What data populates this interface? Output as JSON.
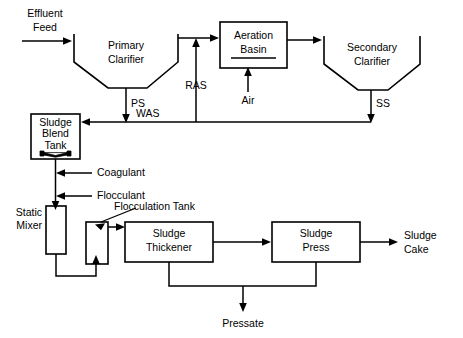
{
  "diagram": {
    "type": "process-flow-diagram",
    "canvas": {
      "width": 463,
      "height": 338
    },
    "colors": {
      "line": "#000000",
      "background": "#ffffff",
      "text": "#000000"
    },
    "units": [
      {
        "id": "primary-clarifier",
        "label_line1": "Primary",
        "label_line2": "Clarifier",
        "shape": "hopper"
      },
      {
        "id": "aeration-basin",
        "label_line1": "Aeration",
        "label_line2": "Basin",
        "shape": "rect"
      },
      {
        "id": "secondary-clarifier",
        "label_line1": "Secondary",
        "label_line2": "Clarifier",
        "shape": "hopper"
      },
      {
        "id": "sludge-blend-tank",
        "label_line1": "Sludge",
        "label_line2": "Blend",
        "label_line3": "Tank",
        "shape": "rect-with-mixer"
      },
      {
        "id": "static-mixer",
        "label_line1": "Static",
        "label_line2": "Mixer",
        "shape": "vertical-rect"
      },
      {
        "id": "flocculation-tank",
        "label": "Flocculation Tank",
        "shape": "vertical-rect"
      },
      {
        "id": "sludge-thickener",
        "label_line1": "Sludge",
        "label_line2": "Thickener",
        "shape": "rect"
      },
      {
        "id": "sludge-press",
        "label_line1": "Sludge",
        "label_line2": "Press",
        "shape": "rect"
      }
    ],
    "streams": [
      {
        "id": "effluent-feed",
        "label_line1": "Effluent",
        "label_line2": "Feed"
      },
      {
        "id": "ps",
        "label": "PS"
      },
      {
        "id": "was",
        "label": "WAS"
      },
      {
        "id": "ras",
        "label": "RAS"
      },
      {
        "id": "air",
        "label": "Air"
      },
      {
        "id": "ss",
        "label": "SS"
      },
      {
        "id": "coagulant",
        "label": "Coagulant"
      },
      {
        "id": "flocculant",
        "label": "Flocculant"
      },
      {
        "id": "sludge-cake",
        "label_line1": "Sludge",
        "label_line2": "Cake"
      },
      {
        "id": "pressate",
        "label": "Pressate"
      }
    ],
    "labels": {
      "effluent_feed_l1": "Effluent",
      "effluent_feed_l2": "Feed",
      "primary_clarifier_l1": "Primary",
      "primary_clarifier_l2": "Clarifier",
      "aeration_basin_l1": "Aeration",
      "aeration_basin_l2": "Basin",
      "secondary_clarifier_l1": "Secondary",
      "secondary_clarifier_l2": "Clarifier",
      "ps": "PS",
      "was": "WAS",
      "ras": "RAS",
      "air": "Air",
      "ss": "SS",
      "sludge_blend_tank_l1": "Sludge",
      "sludge_blend_tank_l2": "Blend",
      "sludge_blend_tank_l3": "Tank",
      "coagulant": "Coagulant",
      "flocculant": "Flocculant",
      "flocculation_tank": "Flocculation Tank",
      "static_mixer_l1": "Static",
      "static_mixer_l2": "Mixer",
      "sludge_thickener_l1": "Sludge",
      "sludge_thickener_l2": "Thickener",
      "sludge_press_l1": "Sludge",
      "sludge_press_l2": "Press",
      "sludge_cake_l1": "Sludge",
      "sludge_cake_l2": "Cake",
      "pressate": "Pressate"
    }
  }
}
